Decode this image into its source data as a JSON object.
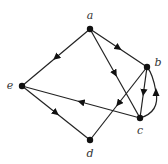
{
  "graph": {
    "type": "directed",
    "nodes": [
      {
        "id": "a",
        "label": "a",
        "x": 90,
        "y": 29,
        "lx": 90,
        "ly": 19
      },
      {
        "id": "b",
        "label": "b",
        "x": 147,
        "y": 67,
        "lx": 158,
        "ly": 66
      },
      {
        "id": "c",
        "label": "c",
        "x": 140,
        "y": 118,
        "lx": 140,
        "ly": 134
      },
      {
        "id": "d",
        "label": "d",
        "x": 90,
        "y": 140,
        "lx": 90,
        "ly": 157
      },
      {
        "id": "e",
        "label": "e",
        "x": 22,
        "y": 86,
        "lx": 10,
        "ly": 89
      }
    ],
    "edges": [
      {
        "from": "a",
        "to": "e"
      },
      {
        "from": "a",
        "to": "b"
      },
      {
        "from": "a",
        "to": "c"
      },
      {
        "from": "b",
        "to": "c"
      },
      {
        "from": "c",
        "to": "b",
        "curved": true
      },
      {
        "from": "b",
        "to": "d"
      },
      {
        "from": "c",
        "to": "e"
      },
      {
        "from": "e",
        "to": "d"
      }
    ]
  }
}
